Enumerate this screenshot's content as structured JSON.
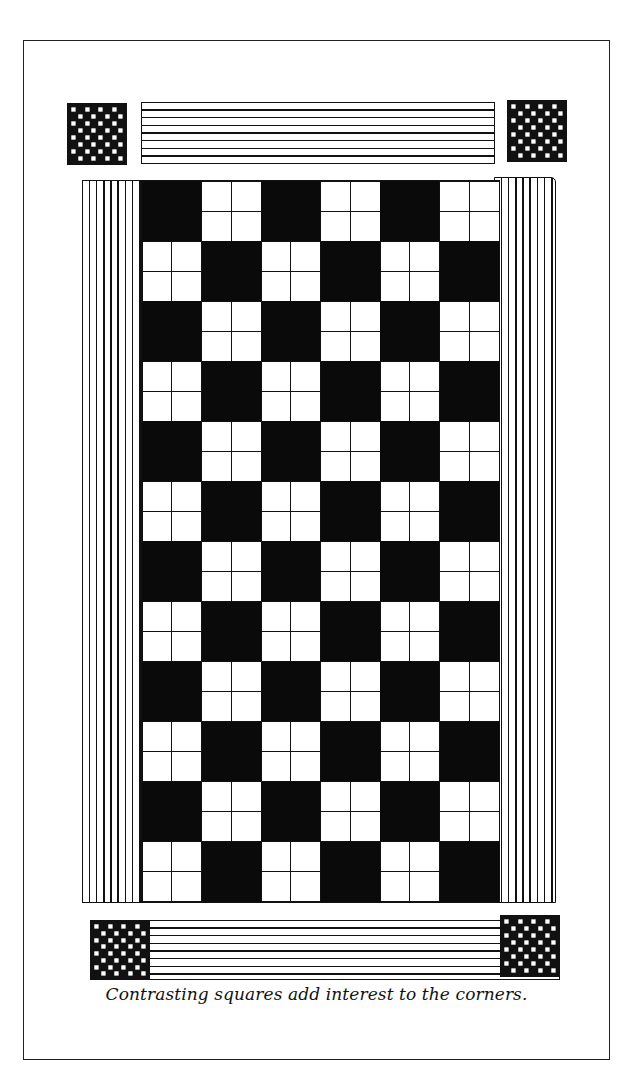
{
  "figure": {
    "caption": "Contrasting squares add interest to the corners.",
    "colors": {
      "ink": "#111111",
      "paper": "#ffffff"
    },
    "main_grid": {
      "columns": 6,
      "rows": 12,
      "first_row_starts_with": "black",
      "white_tile_subdivision": "2x2"
    },
    "corner_squares": {
      "pattern": "checkerboard",
      "cells": 8,
      "positions": [
        "top-left",
        "top-right",
        "bottom-left",
        "bottom-right"
      ]
    },
    "top_band": {
      "stripe_orientation": "horizontal",
      "stripe_count": 8
    },
    "bottom_band": {
      "stripe_orientation": "horizontal",
      "stripe_count": 8
    },
    "side_bands": {
      "stripe_orientation": "vertical",
      "stripe_count": 8
    }
  }
}
